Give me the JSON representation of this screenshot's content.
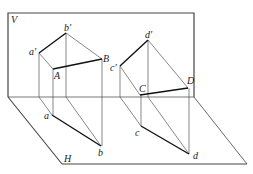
{
  "diagram": {
    "colors": {
      "frame": "#444444",
      "thin": "#555555",
      "thick": "#111111",
      "background": "#ffffff"
    },
    "planes": {
      "V": {
        "label": "V",
        "x1": 8,
        "y1": 13,
        "x2": 194,
        "y2": 97
      },
      "H": {
        "label": "H",
        "points": [
          [
            8,
            97
          ],
          [
            194,
            97
          ],
          [
            247,
            164
          ],
          [
            62,
            164
          ]
        ]
      }
    },
    "labels": {
      "V": "V",
      "H": "H",
      "a_prime": "a'",
      "b_prime": "b'",
      "c_prime": "c'",
      "d_prime": "d'",
      "A": "A",
      "B": "B",
      "C": "C",
      "D": "D",
      "a": "a",
      "b": "b",
      "c": "c",
      "d": "d"
    },
    "points": {
      "a_prime": [
        39,
        53
      ],
      "b_prime": [
        66,
        33
      ],
      "A": [
        53,
        69
      ],
      "B": [
        102,
        59
      ],
      "a": [
        52,
        115
      ],
      "b": [
        101,
        146
      ],
      "c_prime": [
        120,
        66
      ],
      "d_prime": [
        148,
        40
      ],
      "C": [
        140,
        95
      ],
      "D": [
        188,
        88
      ],
      "c": [
        141,
        126
      ],
      "d": [
        189,
        154
      ]
    }
  }
}
